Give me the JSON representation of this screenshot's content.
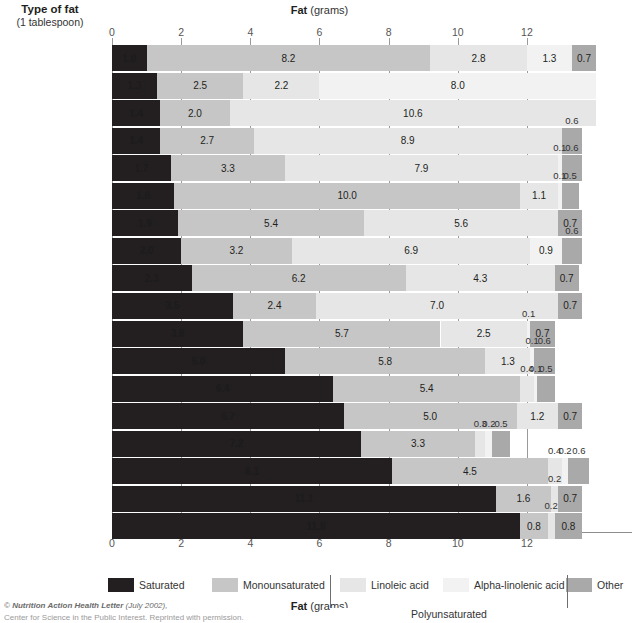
{
  "header": {
    "row_header_line1": "Type of fat",
    "row_header_line2": "(1 tablespoon)",
    "axis_title_bold": "Fat",
    "axis_title_rest": " (grams)"
  },
  "footer": {
    "line1_prefix": "© ",
    "line1_italic": "Nutrition Action Health Letter",
    "line1_suffix": " (July 2002),",
    "line2": "Center for Science in the Public Interest. Reprinted with permission."
  },
  "legend": {
    "items": [
      {
        "key": "sat",
        "label": "Saturated",
        "color": "#231f20"
      },
      {
        "key": "mono",
        "label": "Monounsaturated",
        "color": "#c6c6c6"
      },
      {
        "key": "lin",
        "label": "Linoleic acid",
        "color": "#e6e6e6"
      },
      {
        "key": "ala",
        "label": "Alpha-linolenic acid",
        "color": "#f2f2f2"
      },
      {
        "key": "oth",
        "label": "Other",
        "color": "#a9a9a9"
      }
    ],
    "bracket_label": "Polyunsaturated"
  },
  "chart_data": {
    "type": "bar",
    "orientation": "horizontal",
    "stacked": true,
    "title": "Fat (grams)",
    "xlabel": "Fat (grams)",
    "ylabel": "Type of fat (1 tablespoon)",
    "xlim": [
      0,
      15
    ],
    "xticks": [
      0,
      2,
      4,
      6,
      8,
      10,
      12
    ],
    "grid": true,
    "legend_position": "bottom",
    "series": [
      {
        "name": "Saturated",
        "color": "#231f20"
      },
      {
        "name": "Monounsaturated",
        "color": "#c6c6c6"
      },
      {
        "name": "Linoleic acid",
        "color": "#e6e6e6"
      },
      {
        "name": "Alpha-linolenic acid",
        "color": "#f2f2f2"
      },
      {
        "name": "Other",
        "color": "#a9a9a9"
      }
    ],
    "categories": [
      "Canola oil",
      "Flaxseed oil",
      "Safflower oil",
      "Sunflower oil",
      "Corn oil",
      "Olive oil",
      "Sesame oil",
      "Soybean oil",
      "Peanut oil",
      "Cottonseed oil",
      "Chicken fat",
      "Lard (pork fat)",
      "Beef tallow",
      "Palm oil",
      "Butter",
      "Cocoa butter",
      "Palm kernel oil",
      "Coconut oil"
    ],
    "rows": [
      {
        "label": "Canola oil",
        "sat": 1.0,
        "mono": 8.2,
        "lin": 2.8,
        "ala": 1.3,
        "oth": 0.7
      },
      {
        "label": "Flaxseed oil",
        "sat": 1.3,
        "mono": 2.5,
        "lin": 2.2,
        "ala": 8.0,
        "oth": 0.0
      },
      {
        "label": "Safflower oil",
        "sat": 1.4,
        "mono": 2.0,
        "lin": 10.6,
        "ala": 0.0,
        "oth": 0.0
      },
      {
        "label": "Sunflower oil",
        "sat": 1.4,
        "mono": 2.7,
        "lin": 8.9,
        "ala": 0.0,
        "oth": 0.6
      },
      {
        "label": "Corn oil",
        "sat": 1.7,
        "mono": 3.3,
        "lin": 7.9,
        "ala": 0.1,
        "oth": 0.6
      },
      {
        "label": "Olive oil",
        "sat": 1.8,
        "mono": 10.0,
        "lin": 1.1,
        "ala": 0.1,
        "oth": 0.5
      },
      {
        "label": "Sesame oil",
        "sat": 1.9,
        "mono": 5.4,
        "lin": 5.6,
        "ala": 0.0,
        "oth": 0.7
      },
      {
        "label": "Soybean oil",
        "sat": 2.0,
        "mono": 3.2,
        "lin": 6.9,
        "ala": 0.9,
        "oth": 0.6
      },
      {
        "label": "Peanut oil",
        "sat": 2.3,
        "mono": 6.2,
        "lin": 4.3,
        "ala": 0.0,
        "oth": 0.7
      },
      {
        "label": "Cottonseed oil",
        "sat": 3.5,
        "mono": 2.4,
        "lin": 7.0,
        "ala": 0.0,
        "oth": 0.7
      },
      {
        "label": "Chicken fat",
        "sat": 3.8,
        "mono": 5.7,
        "lin": 2.5,
        "ala": 0.1,
        "oth": 0.7
      },
      {
        "label": "Lard (pork fat)",
        "sat": 5.0,
        "mono": 5.8,
        "lin": 1.3,
        "ala": 0.1,
        "oth": 0.6
      },
      {
        "label": "Beef tallow",
        "sat": 6.4,
        "mono": 5.4,
        "lin": 0.4,
        "ala": 0.1,
        "oth": 0.5
      },
      {
        "label": "Palm oil",
        "sat": 6.7,
        "mono": 5.0,
        "lin": 1.2,
        "ala": 0.0,
        "oth": 0.7
      },
      {
        "label": "Butter",
        "sat": 7.2,
        "mono": 3.3,
        "lin": 0.3,
        "ala": 0.2,
        "oth": 0.5
      },
      {
        "label": "Cocoa butter",
        "sat": 8.1,
        "mono": 4.5,
        "lin": 0.4,
        "ala": 0.2,
        "oth": 0.6
      },
      {
        "label": "Palm kernel oil",
        "sat": 11.1,
        "mono": 1.6,
        "lin": 0.2,
        "ala": 0.0,
        "oth": 0.7
      },
      {
        "label": "Coconut oil",
        "sat": 11.8,
        "mono": 0.8,
        "lin": 0.2,
        "ala": 0.0,
        "oth": 0.8
      }
    ]
  }
}
